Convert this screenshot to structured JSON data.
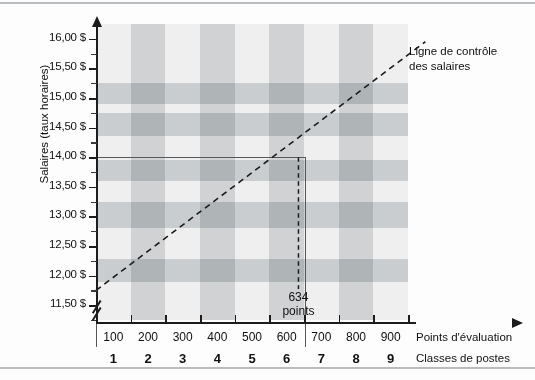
{
  "chart_data": {
    "type": "bar",
    "title": "",
    "xlabel": "Points d'évaluation",
    "xlabel2": "Classes de postes",
    "ylabel": "Salaires (taux horaires)",
    "ylim": [
      11.25,
      16.25
    ],
    "ytick_labels": [
      "16,00 $",
      "15,50 $",
      "15,00 $",
      "14,50 $",
      "14,00 $",
      "13,50 $",
      "13,00 $",
      "12,50 $",
      "12,00 $",
      "11,50 $"
    ],
    "ytick_values": [
      16.0,
      15.5,
      15.0,
      14.5,
      14.0,
      13.5,
      13.0,
      12.5,
      12.0,
      11.5
    ],
    "axis_break": true,
    "grid": false,
    "legend_position": "none",
    "categories": [
      "100",
      "200",
      "300",
      "400",
      "500",
      "600",
      "700",
      "800",
      "900"
    ],
    "classes": [
      "1",
      "2",
      "3",
      "4",
      "5",
      "6",
      "7",
      "8",
      "9"
    ],
    "salary_bands": [
      {
        "class_from": 1,
        "class_to": 9,
        "top": 15.25,
        "bottom": 14.9,
        "color": "#c9cdcf"
      },
      {
        "class_from": 1,
        "class_to": 9,
        "top": 14.75,
        "bottom": 14.35,
        "color": "#c9cdcf"
      },
      {
        "class_from": 1,
        "class_to": 9,
        "top": 13.95,
        "bottom": 13.6,
        "color": "#c9cdcf"
      },
      {
        "class_from": 1,
        "class_to": 9,
        "top": 13.25,
        "bottom": 12.8,
        "color": "#c9cdcf"
      },
      {
        "class_from": 1,
        "class_to": 9,
        "top": 12.28,
        "bottom": 11.9,
        "color": "#c9cdcf"
      }
    ],
    "class_columns": [
      {
        "class": 2,
        "color": "#c9cdcf"
      },
      {
        "class": 4,
        "color": "#c9cdcf"
      },
      {
        "class": 6,
        "color": "#c9cdcf"
      },
      {
        "class": 8,
        "color": "#c9cdcf"
      }
    ],
    "control_line": {
      "label": "Ligne de contrôle\ndes salaires",
      "label_line1": "Ligne de contrôle",
      "label_line2": "des salaires",
      "style": "dashed",
      "x_start_points": 50,
      "y_start": 11.75,
      "x_end_points": 1000,
      "y_end": 15.95
    },
    "marker": {
      "points": 634,
      "label_line1": "634",
      "label_line2": "points",
      "value": 14.0
    },
    "highlight_rect": {
      "y_top": 14.0,
      "x_right_points": 650,
      "border_color": "#55585a"
    },
    "colors": {
      "band": "#c9cdcf",
      "plot_background": "#efefef",
      "axis": "#1c1c1c",
      "rule": "#b9bcbe"
    }
  }
}
